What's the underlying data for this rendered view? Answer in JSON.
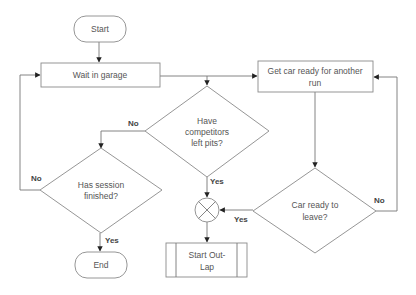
{
  "diagram": {
    "type": "flowchart",
    "colors": {
      "stroke": "#8a8a8a",
      "text": "#555555",
      "label": "#444444",
      "arrow": "#222222"
    },
    "nodes": {
      "start": {
        "shape": "terminator",
        "label": "Start"
      },
      "wait_garage": {
        "shape": "process",
        "label": "Wait in garage"
      },
      "get_car_ready": {
        "shape": "process",
        "label_line1": "Get car ready for another",
        "label_line2": "run"
      },
      "competitors_left": {
        "shape": "decision",
        "label_line1": "Have",
        "label_line2": "competitors",
        "label_line3": "left pits?"
      },
      "session_finished": {
        "shape": "decision",
        "label_line1": "Has session",
        "label_line2": "finished?"
      },
      "car_ready_leave": {
        "shape": "decision",
        "label_line1": "Car ready to",
        "label_line2": "leave?"
      },
      "junction": {
        "shape": "summing-junction",
        "label": ""
      },
      "start_outlap": {
        "shape": "predefined-process",
        "label_line1": "Start Out-",
        "label_line2": "Lap"
      },
      "end": {
        "shape": "terminator",
        "label": "End"
      }
    },
    "edges": {
      "competitors_no": {
        "from": "competitors_left",
        "to": "session_finished",
        "label": "No"
      },
      "competitors_yes": {
        "from": "competitors_left",
        "to": "junction",
        "label": "Yes"
      },
      "session_no": {
        "from": "session_finished",
        "to": "wait_garage",
        "label": "No"
      },
      "session_yes": {
        "from": "session_finished",
        "to": "end",
        "label": "Yes"
      },
      "car_ready_yes": {
        "from": "car_ready_leave",
        "to": "junction",
        "label": "Yes"
      },
      "car_ready_no": {
        "from": "car_ready_leave",
        "to": "get_car_ready",
        "label": "No"
      }
    }
  }
}
